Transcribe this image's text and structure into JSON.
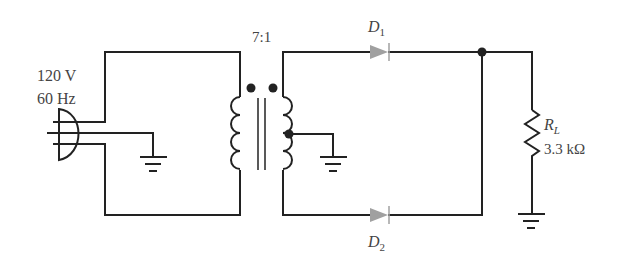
{
  "source": {
    "voltage": "120 V",
    "frequency": "60 Hz"
  },
  "transformer": {
    "ratio": "7:1"
  },
  "diodes": [
    {
      "name": "D",
      "sub": "1"
    },
    {
      "name": "D",
      "sub": "2"
    }
  ],
  "load": {
    "name": "R",
    "sub": "L",
    "value": "3.3 kΩ"
  },
  "colors": {
    "wire": "#222222",
    "diode": "#a0a0a0",
    "text": "#444444"
  }
}
